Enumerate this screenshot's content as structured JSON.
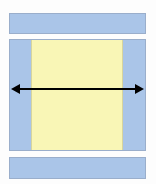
{
  "diagram": {
    "background_color": "#fdfdfd",
    "canvas": {
      "width": 156,
      "height": 184
    },
    "colors": {
      "blue_fill": "#aac5e8",
      "blue_stroke": "#9aaecb",
      "yellow_fill": "#f9f6b6",
      "yellow_stroke": "#d8d59c",
      "arrow_color": "#000000"
    },
    "shapes": [
      {
        "id": "top-bar",
        "label": "top blue bar",
        "fill": "#aac5e8",
        "x": 9,
        "y": 13,
        "width": 137,
        "height": 21
      },
      {
        "id": "middle-band",
        "label": "middle blue band",
        "fill": "#aac5e8",
        "x": 9,
        "y": 39,
        "width": 137,
        "height": 112
      },
      {
        "id": "yellow-inset",
        "label": "yellow inset region",
        "fill": "#f9f6b6",
        "x": 31,
        "y": 40,
        "width": 92,
        "height": 110
      },
      {
        "id": "bottom-bar",
        "label": "bottom blue bar",
        "fill": "#aac5e8",
        "x": 9,
        "y": 157,
        "width": 137,
        "height": 22
      }
    ],
    "arrow": {
      "id": "span-arrow",
      "label": "double headed horizontal arrow",
      "style": "double-headed",
      "color": "#000000",
      "x_start": 11,
      "x_end": 144,
      "y": 89,
      "line_thickness": 2,
      "head_length": 9,
      "head_half_width": 5,
      "annotation": ""
    }
  }
}
